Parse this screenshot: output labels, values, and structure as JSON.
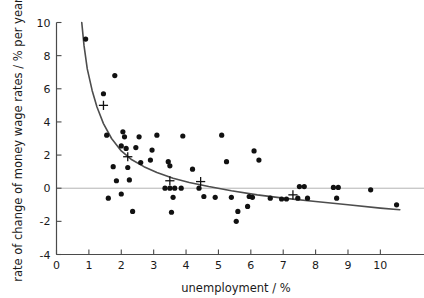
{
  "chart_data": {
    "type": "scatter",
    "title": "",
    "xlabel": "unemployment / %",
    "ylabel": "rate of change of money wage rates / % per year",
    "xlim": [
      0,
      11.1
    ],
    "ylim": [
      -4,
      10
    ],
    "xticks": [
      0,
      1,
      2,
      3,
      4,
      5,
      6,
      7,
      8,
      9,
      10
    ],
    "xtick_labels": [
      "0",
      "1",
      "2",
      "3",
      "4",
      "5",
      "6",
      "7",
      "8",
      "9",
      "10"
    ],
    "yticks": [
      -4,
      -2,
      0,
      2,
      4,
      6,
      8,
      10
    ],
    "ytick_labels": [
      "-4",
      "-2",
      "0",
      "2",
      "4",
      "6",
      "8",
      "10"
    ],
    "grid": false,
    "zero_line": {
      "y": 0,
      "color": "#b3b3b3",
      "label": "zero reference line"
    },
    "legend": null,
    "series": [
      {
        "name": "observations",
        "marker": "filled-circle",
        "color": "#111111",
        "points": [
          [
            0.9,
            9.0
          ],
          [
            1.45,
            5.7
          ],
          [
            1.8,
            6.8
          ],
          [
            1.55,
            3.2
          ],
          [
            2.05,
            3.4
          ],
          [
            2.1,
            3.1
          ],
          [
            2.0,
            2.55
          ],
          [
            2.15,
            2.4
          ],
          [
            1.75,
            1.3
          ],
          [
            2.2,
            1.25
          ],
          [
            1.85,
            0.45
          ],
          [
            2.25,
            0.5
          ],
          [
            2.0,
            -0.35
          ],
          [
            1.6,
            -0.6
          ],
          [
            2.45,
            2.45
          ],
          [
            2.55,
            3.1
          ],
          [
            2.6,
            1.55
          ],
          [
            2.9,
            1.7
          ],
          [
            2.95,
            2.3
          ],
          [
            3.1,
            3.2
          ],
          [
            3.45,
            1.6
          ],
          [
            3.5,
            1.35
          ],
          [
            3.35,
            0.0
          ],
          [
            3.5,
            0.0
          ],
          [
            3.65,
            0.0
          ],
          [
            3.85,
            0.0
          ],
          [
            3.6,
            -0.55
          ],
          [
            3.55,
            -1.45
          ],
          [
            3.9,
            3.15
          ],
          [
            4.2,
            1.15
          ],
          [
            4.4,
            0.0
          ],
          [
            4.55,
            -0.5
          ],
          [
            5.1,
            3.2
          ],
          [
            5.25,
            1.6
          ],
          [
            5.4,
            -0.55
          ],
          [
            5.6,
            -1.4
          ],
          [
            5.55,
            -2.0
          ],
          [
            5.95,
            -0.5
          ],
          [
            6.05,
            -0.55
          ],
          [
            5.9,
            -1.1
          ],
          [
            6.1,
            2.25
          ],
          [
            6.25,
            1.7
          ],
          [
            6.6,
            -0.6
          ],
          [
            6.95,
            -0.65
          ],
          [
            7.1,
            -0.65
          ],
          [
            7.5,
            0.1
          ],
          [
            7.65,
            0.1
          ],
          [
            7.45,
            -0.6
          ],
          [
            7.75,
            -0.6
          ],
          [
            8.55,
            0.05
          ],
          [
            8.7,
            0.05
          ],
          [
            8.65,
            -0.6
          ],
          [
            9.7,
            -0.1
          ],
          [
            10.5,
            -1.0
          ],
          [
            2.35,
            -1.4
          ],
          [
            4.9,
            -0.55
          ]
        ]
      },
      {
        "name": "fitted-means",
        "marker": "plus-cross",
        "color": "#111111",
        "points": [
          [
            1.45,
            5.0
          ],
          [
            2.2,
            1.9
          ],
          [
            3.5,
            0.45
          ],
          [
            4.45,
            0.4
          ],
          [
            7.3,
            -0.4
          ]
        ]
      }
    ],
    "fitted_curve": {
      "name": "Phillips curve fit",
      "color": "#4d4d4d",
      "width": 1.6,
      "points": [
        [
          0.78,
          10.0
        ],
        [
          0.85,
          8.6
        ],
        [
          0.95,
          7.2
        ],
        [
          1.1,
          5.9
        ],
        [
          1.25,
          4.9
        ],
        [
          1.45,
          3.9
        ],
        [
          1.7,
          3.0
        ],
        [
          2.0,
          2.25
        ],
        [
          2.3,
          1.75
        ],
        [
          2.7,
          1.3
        ],
        [
          3.1,
          0.95
        ],
        [
          3.6,
          0.6
        ],
        [
          4.1,
          0.35
        ],
        [
          4.7,
          0.1
        ],
        [
          5.4,
          -0.15
        ],
        [
          6.2,
          -0.4
        ],
        [
          7.0,
          -0.6
        ],
        [
          8.0,
          -0.8
        ],
        [
          9.0,
          -1.0
        ],
        [
          10.0,
          -1.2
        ],
        [
          10.6,
          -1.3
        ]
      ]
    }
  }
}
